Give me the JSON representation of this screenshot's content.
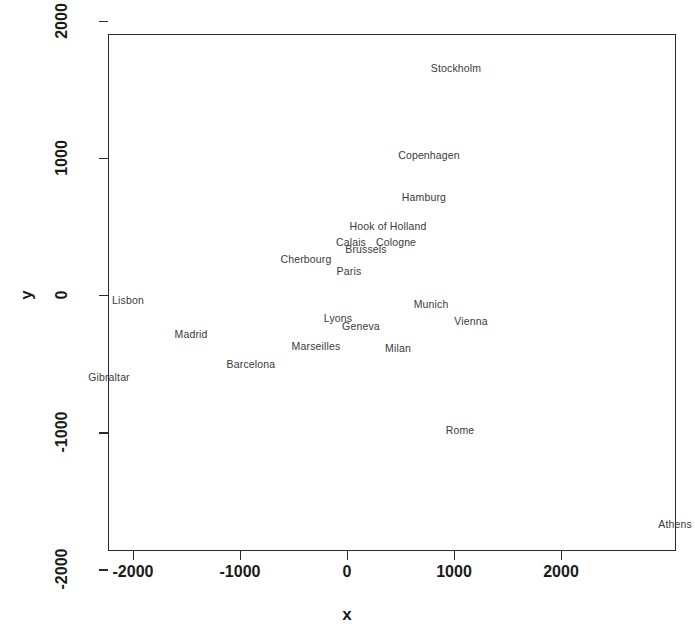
{
  "chart_data": {
    "type": "scatter",
    "title": "",
    "subtitle": "",
    "xlabel": "x",
    "ylabel": "y",
    "xlim": [
      -2235,
      3075
    ],
    "ylim": [
      -2100,
      1900
    ],
    "xticks": [
      -2000,
      -1000,
      0,
      1000,
      2000
    ],
    "xticklabels": [
      "-2000",
      "-1000",
      "0",
      "1000",
      "2000"
    ],
    "yticks": [
      2000,
      1000,
      0,
      -1000,
      -2000
    ],
    "yticklabels": [
      "2000",
      "1000",
      "0",
      "-1000",
      "-2000"
    ],
    "grid": false,
    "legend": null,
    "marker": "text-label-only",
    "note": "Points are rendered as city name text labels only; no marker glyphs are drawn.",
    "points": [
      {
        "label": "Stockholm",
        "x": 1009,
        "y": 1662
      },
      {
        "label": "Copenhagen",
        "x": 757,
        "y": 1028
      },
      {
        "label": "Hamburg",
        "x": 710,
        "y": 722
      },
      {
        "label": "Hook of Holland",
        "x": 374,
        "y": 510
      },
      {
        "label": "Calais",
        "x": 28,
        "y": 394
      },
      {
        "label": "Cologne",
        "x": 449,
        "y": 394
      },
      {
        "label": "Brussels",
        "x": 168,
        "y": 343
      },
      {
        "label": "Cherbourg",
        "x": -393,
        "y": 270
      },
      {
        "label": "Paris",
        "x": 9,
        "y": 182
      },
      {
        "label": "Lisbon",
        "x": -2056,
        "y": -29
      },
      {
        "label": "Munich",
        "x": 776,
        "y": -58
      },
      {
        "label": "Lyons",
        "x": -93,
        "y": -160
      },
      {
        "label": "Vienna",
        "x": 1150,
        "y": -182
      },
      {
        "label": "Geneva",
        "x": 121,
        "y": -219
      },
      {
        "label": "Madrid",
        "x": -1467,
        "y": -277
      },
      {
        "label": "Marseilles",
        "x": -299,
        "y": -364
      },
      {
        "label": "Milan",
        "x": 467,
        "y": -379
      },
      {
        "label": "Barcelona",
        "x": -907,
        "y": -496
      },
      {
        "label": "Gibraltar",
        "x": -2234,
        "y": -590
      },
      {
        "label": "Rome",
        "x": 1047,
        "y": -977
      },
      {
        "label": "Athens",
        "x": 3057,
        "y": -1662
      }
    ]
  },
  "figure": {
    "background_color": "#ffffff",
    "axis_color": "#2b2b2b",
    "label_color": "#3a3a3a",
    "tick_label_color": "#1a1a1a"
  }
}
